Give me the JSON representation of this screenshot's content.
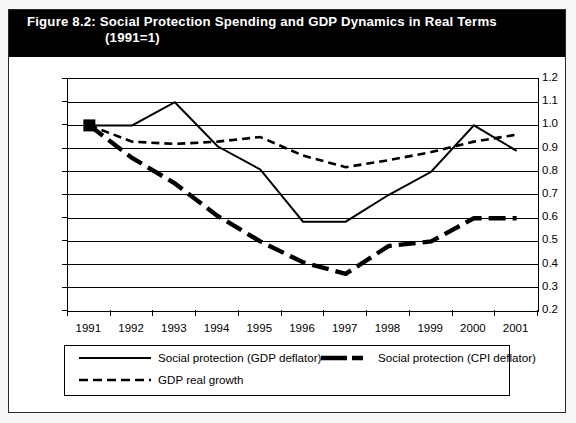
{
  "figure": {
    "title_line1": "Figure 8.2: Social Protection Spending and GDP Dynamics in Real Terms",
    "title_line2": "(1991=1)"
  },
  "chart_data": {
    "type": "line",
    "title": "Figure 8.2: Social Protection Spending and GDP Dynamics in Real Terms (1991=1)",
    "xlabel": "",
    "ylabel": "",
    "ylim": [
      0.2,
      1.2
    ],
    "ytick_step": 0.1,
    "yticks": [
      "1.2",
      "1.1",
      "1.0",
      "0.9",
      "0.8",
      "0.7",
      "0.6",
      "0.5",
      "0.4",
      "0.3",
      "0.2"
    ],
    "grid": true,
    "legend_position": "below-plot",
    "categories": [
      "1991",
      "1992",
      "1993",
      "1994",
      "1995",
      "1996",
      "1997",
      "1998",
      "1999",
      "2000",
      "2001"
    ],
    "series": [
      {
        "name": "Social protection (GDP deflator)",
        "style": "solid-thin",
        "values": [
          1.0,
          1.0,
          1.1,
          0.91,
          0.81,
          0.585,
          0.585,
          0.7,
          0.8,
          1.0,
          0.89
        ]
      },
      {
        "name": "Social protection (CPI deflator)",
        "style": "thick-dashed",
        "values": [
          1.0,
          0.86,
          0.75,
          0.61,
          0.5,
          0.41,
          0.36,
          0.48,
          0.5,
          0.6,
          0.6
        ]
      },
      {
        "name": "GDP real growth",
        "style": "thin-dashed",
        "values": [
          1.0,
          0.93,
          0.92,
          0.93,
          0.95,
          0.87,
          0.82,
          0.85,
          0.885,
          0.93,
          0.96
        ]
      }
    ],
    "start_marker": {
      "x": "1991",
      "y": 1.0,
      "shape": "square",
      "color": "#000000"
    }
  },
  "legend": {
    "items": [
      {
        "label": "Social protection (GDP deflator)",
        "style": "solid-thin"
      },
      {
        "label": "Social protection (CPI deflator)",
        "style": "thick-dashed"
      },
      {
        "label": "GDP real growth",
        "style": "thin-dashed"
      }
    ]
  },
  "colors": {
    "line": "#000000",
    "title_bg": "#000000",
    "title_fg": "#ffffff",
    "plot_bg": "#ffffff",
    "page_bg": "#f7f7f5"
  }
}
